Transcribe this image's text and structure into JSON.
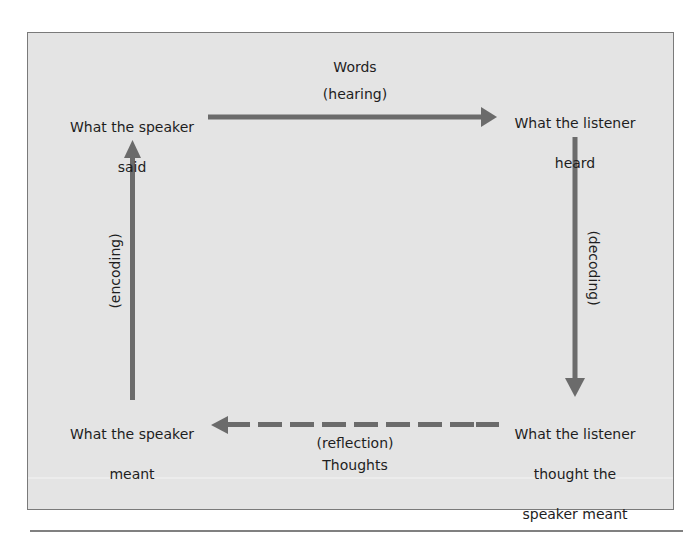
{
  "diagram": {
    "type": "communication-cycle",
    "colors": {
      "background": "#e4e4e4",
      "frame_border": "#7a7a7a",
      "arrow": "#6b6b6b",
      "text": "#1e1e1e"
    },
    "nodes": {
      "speaker_said": {
        "line1": "What the speaker",
        "line2": "said"
      },
      "listener_heard": {
        "line1": "What the listener",
        "line2": "heard"
      },
      "listener_thought": {
        "line1": "What the listener",
        "line2": "thought the",
        "line3": "speaker meant"
      },
      "speaker_meant": {
        "line1": "What the speaker",
        "line2": "meant"
      }
    },
    "edges": {
      "top": {
        "from": "speaker_said",
        "to": "listener_heard",
        "label": "Words",
        "sublabel": "(hearing)",
        "style": "solid"
      },
      "right": {
        "from": "listener_heard",
        "to": "listener_thought",
        "label": "(decoding)",
        "style": "solid"
      },
      "bottom": {
        "from": "listener_thought",
        "to": "speaker_meant",
        "label": "(reflection)",
        "sublabel": "Thoughts",
        "style": "dashed"
      },
      "left": {
        "from": "speaker_meant",
        "to": "speaker_said",
        "label": "(encoding)",
        "style": "solid"
      }
    }
  }
}
